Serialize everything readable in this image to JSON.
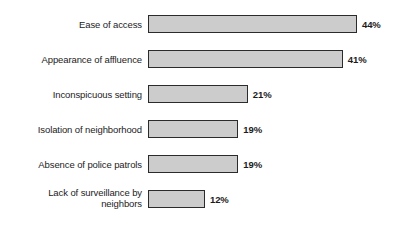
{
  "chart_data": {
    "type": "bar",
    "orientation": "horizontal",
    "title": "",
    "subtitle": "",
    "xlabel": "",
    "ylabel": "",
    "grid": false,
    "legend": false,
    "xlim": [
      0,
      44
    ],
    "value_suffix": "%",
    "categories": [
      "Ease of access",
      "Appearance of affluence",
      "Inconspicuous setting",
      "Isolation of neighborhood",
      "Absence of police patrols",
      "Lack of surveillance by\nneighbors"
    ],
    "values": [
      44,
      41,
      21,
      19,
      19,
      12
    ],
    "value_labels": [
      "44%",
      "41%",
      "21%",
      "19%",
      "19%",
      "12%"
    ],
    "colors": {
      "bar_fill": "#cccccc",
      "bar_border": "#2b2b2b",
      "background": "#ffffff",
      "text": "#1c1c1c"
    }
  }
}
